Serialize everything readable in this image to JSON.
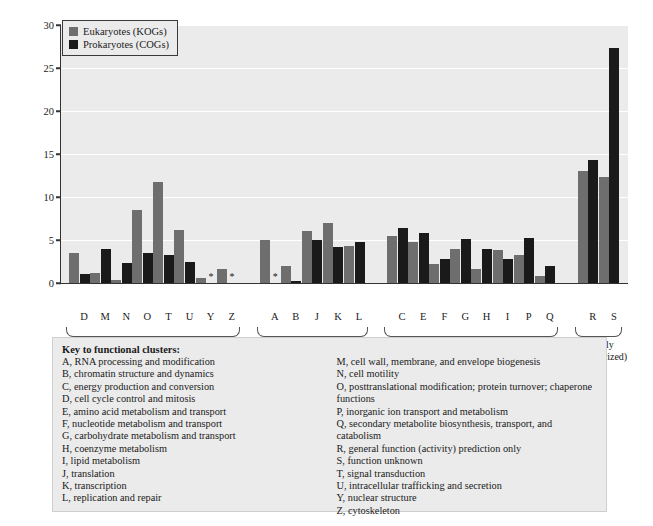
{
  "chart_data": {
    "type": "bar",
    "title": "",
    "xlabel": "",
    "ylabel": "Percent of clusters in each category",
    "ylim": [
      0,
      30
    ],
    "yticks": [
      0,
      5,
      10,
      15,
      20,
      25,
      30
    ],
    "grid": true,
    "legend_position": "top-left inside plot",
    "categories": [
      "D",
      "M",
      "N",
      "O",
      "T",
      "U",
      "Y",
      "Z",
      "A",
      "B",
      "J",
      "K",
      "L",
      "C",
      "E",
      "F",
      "G",
      "H",
      "I",
      "P",
      "Q",
      "R",
      "S"
    ],
    "series": [
      {
        "name": "Eukaryotes (KOGs)",
        "color": "#6e6e6e",
        "values": [
          3.5,
          1.2,
          0.4,
          8.5,
          11.7,
          6.2,
          0.6,
          1.6,
          5.0,
          2.0,
          6.0,
          7.0,
          4.3,
          5.5,
          4.8,
          2.2,
          4.0,
          1.6,
          3.8,
          3.3,
          0.8,
          13.0,
          12.3
        ]
      },
      {
        "name": "Prokaryotes (COGs)",
        "color": "#1a1a1a",
        "values": [
          1.0,
          4.0,
          2.3,
          3.5,
          3.3,
          2.4,
          0.0,
          0.0,
          0.0,
          0.2,
          5.0,
          4.2,
          4.8,
          6.4,
          5.8,
          2.8,
          5.1,
          3.9,
          2.8,
          5.2,
          2.0,
          14.3,
          27.3
        ]
      }
    ],
    "annotations": [
      {
        "category": "Y",
        "series": "Prokaryotes (COGs)",
        "marker": "*"
      },
      {
        "category": "Z",
        "series": "Prokaryotes (COGs)",
        "marker": "*"
      },
      {
        "category": "A",
        "series": "Prokaryotes (COGs)",
        "marker": "*"
      }
    ],
    "groups": [
      {
        "label": "Cellular processes\nand signaling",
        "categories": [
          "D",
          "M",
          "N",
          "O",
          "T",
          "U",
          "Y",
          "Z"
        ]
      },
      {
        "label": "Information storage\nand processes",
        "categories": [
          "A",
          "B",
          "J",
          "K",
          "L"
        ]
      },
      {
        "label": "Metabolism",
        "categories": [
          "C",
          "E",
          "F",
          "G",
          "H",
          "I",
          "P",
          "Q"
        ]
      },
      {
        "label": "(Poorly\ncharacterized)",
        "categories": [
          "R",
          "S"
        ]
      }
    ]
  },
  "legend": {
    "items": [
      {
        "label": "Eukaryotes (KOGs)",
        "color": "#6e6e6e"
      },
      {
        "label": "Prokaryotes (COGs)",
        "color": "#1a1a1a"
      }
    ]
  },
  "axis": {
    "ylabel": "Percent of clusters in each category",
    "ytick_labels": [
      "0",
      "5",
      "10",
      "15",
      "20",
      "25",
      "30"
    ],
    "xtick_labels": [
      "D",
      "M",
      "N",
      "O",
      "T",
      "U",
      "Y",
      "Z",
      "A",
      "B",
      "J",
      "K",
      "L",
      "C",
      "E",
      "F",
      "G",
      "H",
      "I",
      "P",
      "Q",
      "R",
      "S"
    ]
  },
  "group_labels": [
    {
      "line1": "Cellular processes",
      "line2": "and signaling"
    },
    {
      "line1": "Information storage",
      "line2": "and processes"
    },
    {
      "line1": "Metabolism",
      "line2": ""
    },
    {
      "line1": "(Poorly",
      "line2": "characterized)"
    }
  ],
  "key": {
    "title": "Key to functional clusters:",
    "left_column": [
      "A, RNA processing and modification",
      "B, chromatin structure and dynamics",
      "C, energy production and conversion",
      "D, cell cycle control and mitosis",
      "E, amino acid metabolism and transport",
      "F, nucleotide metabolism and transport",
      "G, carbohydrate metabolism and transport",
      "H, coenzyme metabolism",
      "I, lipid metabolism",
      "J, translation",
      "K, transcription",
      "L, replication and repair"
    ],
    "right_column": [
      "M, cell wall, membrane, and envelope biogenesis",
      "N, cell motility",
      "O, posttranslational modification; protein turnover; chaperone functions",
      "P, inorganic ion transport and metabolism",
      "Q, secondary metabolite biosynthesis, transport, and catabolism",
      "R, general function (activity) prediction only",
      "S, function unknown",
      "T, signal transduction",
      "U, intracellular trafficking and secretion",
      "Y, nuclear structure",
      "Z, cytoskeleton"
    ]
  }
}
